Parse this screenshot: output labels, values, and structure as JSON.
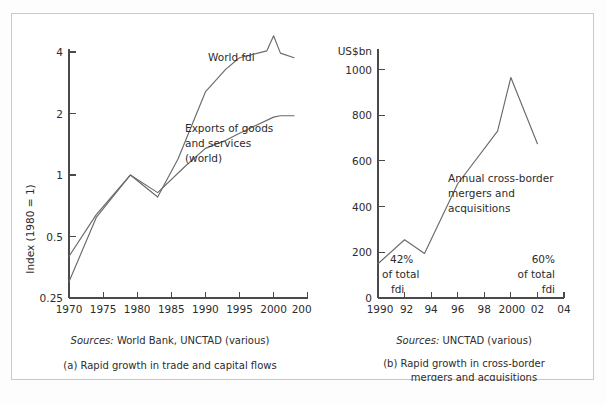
{
  "figure": {
    "background": "#ffffff",
    "border_color": "#c9c9c9",
    "line_color": "#6a6a6a",
    "axis_color": "#4a4a4a"
  },
  "panel_a": {
    "source_note_italic": "Sources:",
    "source_note_rest": " World Bank, UNCTAD (various)",
    "caption": "(a) Rapid growth in trade and capital flows",
    "y_axis_title": "Index (1980 = 1)",
    "series_labels": {
      "world_fdi": "World fdi",
      "exports_line1": "Exports of goods",
      "exports_line2": "and services",
      "exports_line3": "(world)"
    }
  },
  "panel_b": {
    "source_note_italic": "Sources:",
    "source_note_rest": " UNCTAD (various)",
    "caption_line1": "(b) Rapid growth in cross-border",
    "caption_line2": "mergers and acquisitions",
    "y_unit": "US$bn",
    "series_label_line1": "Annual cross-border",
    "series_label_line2": "mergers and",
    "series_label_line3": "acquisitions",
    "annotation_left_line1": "42%",
    "annotation_left_line2": "of total",
    "annotation_left_line3": "fdi",
    "annotation_right_line1": "60%",
    "annotation_right_line2": "of total",
    "annotation_right_line3": "fdi"
  },
  "chart_data": [
    {
      "id": "panel-a",
      "type": "line",
      "title": "(a) Rapid growth in trade and capital flows",
      "xlabel": "",
      "ylabel": "Index (1980 = 1)",
      "yscale": "log",
      "ylim": [
        0.25,
        5
      ],
      "xlim": [
        1970,
        2005
      ],
      "ytick_labels": [
        "0.25",
        "0.5",
        "1",
        "2",
        "4"
      ],
      "ytick_values": [
        0.25,
        0.5,
        1,
        2,
        4
      ],
      "xtick_labels": [
        "1970",
        "1975",
        "1980",
        "1985",
        "1990",
        "1995",
        "2000",
        "2005"
      ],
      "xtick_values": [
        1970,
        1975,
        1980,
        1985,
        1990,
        1995,
        2000,
        2005
      ],
      "grid": false,
      "legend": "inline-annotations",
      "series": [
        {
          "name": "World fdi",
          "x": [
            1970,
            1974,
            1979,
            1983,
            1986,
            1990,
            1993,
            1995,
            1999,
            2000,
            2001,
            2003
          ],
          "y": [
            0.3,
            0.62,
            1.0,
            0.78,
            1.2,
            2.55,
            3.3,
            3.75,
            4.05,
            4.8,
            3.95,
            3.75
          ]
        },
        {
          "name": "Exports of goods and services (world)",
          "x": [
            1970,
            1974,
            1979,
            1983,
            1987,
            1990,
            1993,
            1995,
            2000,
            2001,
            2003
          ],
          "y": [
            0.4,
            0.64,
            1.0,
            0.82,
            1.1,
            1.35,
            1.48,
            1.6,
            1.92,
            1.95,
            1.95
          ]
        }
      ]
    },
    {
      "id": "panel-b",
      "type": "line",
      "title": "(b) Rapid growth in cross-border mergers and acquisitions",
      "xlabel": "",
      "ylabel": "US$bn",
      "yscale": "linear",
      "ylim": [
        0,
        1080
      ],
      "xlim": [
        1990,
        2004
      ],
      "ytick_labels": [
        "0",
        "200",
        "400",
        "600",
        "800",
        "1000"
      ],
      "ytick_values": [
        0,
        200,
        400,
        600,
        800,
        1000
      ],
      "xtick_labels": [
        "1990",
        "92",
        "94",
        "96",
        "98",
        "2000",
        "02",
        "04"
      ],
      "xtick_values": [
        1990,
        1992,
        1994,
        1996,
        1998,
        2000,
        2002,
        2004
      ],
      "grid": false,
      "annotations": [
        {
          "text": "42% of total fdi",
          "x": 1990,
          "y": 150
        },
        {
          "text": "60% of total fdi",
          "x": 2002,
          "y": 150
        }
      ],
      "series": [
        {
          "name": "Annual cross-border mergers and acquisitions",
          "x": [
            1990,
            1992,
            1993.5,
            1996,
            1999,
            2000,
            2002
          ],
          "y": [
            150,
            255,
            195,
            500,
            730,
            965,
            675
          ]
        }
      ]
    }
  ]
}
